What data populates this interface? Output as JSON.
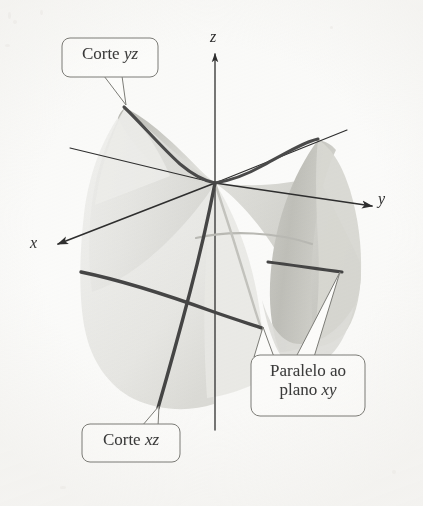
{
  "figure": {
    "kind": "3d-surface-diagram",
    "surface_name": "hyperbolic-paraboloid-saddle",
    "background_color": "#fbfbfa",
    "ink_color": "#3a3a3a",
    "surface_fill_light": "#ededea",
    "surface_fill_mid": "#dcdcd8",
    "surface_fill_dark": "#c4c4bf",
    "trace_color": "#4a4a4a",
    "hidden_trace_color": "#b9b9b4"
  },
  "axes": [
    {
      "id": "z",
      "label": "z",
      "direction": "up",
      "has_arrow": true
    },
    {
      "id": "y",
      "label": "y",
      "direction": "right-down",
      "has_arrow": true
    },
    {
      "id": "x",
      "label": "x",
      "direction": "left-down",
      "has_arrow": true
    }
  ],
  "callouts": [
    {
      "id": "corte-yz",
      "text_plain": "Corte yz",
      "text_roman": "Corte ",
      "text_italic": "yz",
      "pointer_targets": 1,
      "points_to": "yz-trace-left-peak"
    },
    {
      "id": "corte-xz",
      "text_plain": "Corte xz",
      "text_roman": "Corte ",
      "text_italic": "xz",
      "pointer_targets": 1,
      "points_to": "xz-trace-lower-end"
    },
    {
      "id": "paralelo-ao-plano-xy",
      "line1_roman": "Paralelo ao",
      "line2_roman": "plano ",
      "line2_italic": "xy",
      "text_plain": "Paralelo ao plano xy",
      "pointer_targets": 2,
      "points_to": "xy-parallel-trace"
    }
  ],
  "traces": [
    {
      "id": "yz-trace",
      "label": "Corte yz",
      "style": "solid-dark",
      "visible": true
    },
    {
      "id": "xz-trace",
      "label": "Corte xz",
      "style": "solid-dark",
      "visible": true
    },
    {
      "id": "xy-parallel-trace",
      "label": "Paralelo ao plano xy",
      "style": "solid-dark",
      "visible": true
    },
    {
      "id": "xy-parallel-hidden",
      "label": "Paralelo ao plano xy",
      "style": "solid-light",
      "visible": true
    }
  ]
}
